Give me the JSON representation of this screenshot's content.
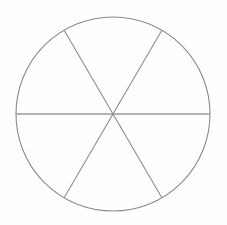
{
  "figure": {
    "background_color": "#fefefe",
    "stroke_color": "#8a8a8a",
    "horizontal_stroke_color": "#9a9a9a",
    "stroke_width": 1,
    "width": 227,
    "height": 225
  },
  "chart_data": {
    "type": "pie",
    "categories": [
      "Sector 1",
      "Sector 2",
      "Sector 3",
      "Sector 4",
      "Sector 5",
      "Sector 6"
    ],
    "values": [
      1,
      1,
      1,
      1,
      1,
      1
    ],
    "slice_angle_degrees": 60,
    "total_slices": 6,
    "filled_slices": 0,
    "legend": "none",
    "labels_shown": "none",
    "xlabel": "",
    "ylabel": ""
  },
  "geometry": {
    "center": {
      "x": 113,
      "y": 114
    },
    "radius": 97,
    "circle_label": "outer circle",
    "diameters": [
      {
        "name": "horizontal-diameter",
        "angle_degrees": 0
      },
      {
        "name": "diameter-60",
        "angle_degrees": 60
      },
      {
        "name": "diameter-120",
        "angle_degrees": 120
      }
    ],
    "spoke_endpoints": [
      {
        "name": "endpoint-left",
        "x": 16,
        "y": 114
      },
      {
        "name": "endpoint-right",
        "x": 210,
        "y": 114
      },
      {
        "name": "endpoint-upper-left",
        "x": 64,
        "y": 30
      },
      {
        "name": "endpoint-lower-right",
        "x": 162,
        "y": 198
      },
      {
        "name": "endpoint-upper-right",
        "x": 162,
        "y": 30
      },
      {
        "name": "endpoint-lower-left",
        "x": 64,
        "y": 198
      }
    ]
  }
}
